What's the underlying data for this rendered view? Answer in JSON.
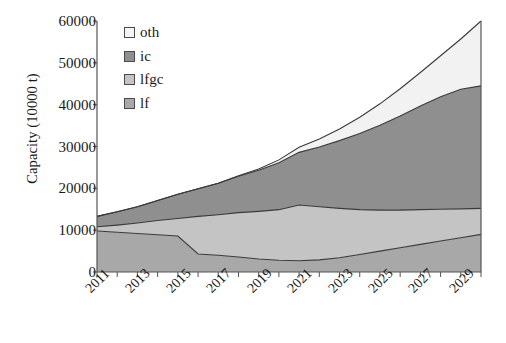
{
  "chart_data": {
    "type": "area",
    "stacked": true,
    "title": "",
    "xlabel": "",
    "ylabel": "Capacity (10000 t)",
    "ylim": [
      0,
      60000
    ],
    "ytick_labels": [
      "0",
      "10000",
      "20000",
      "30000",
      "40000",
      "50000",
      "60000"
    ],
    "ytick_values": [
      0,
      10000,
      20000,
      30000,
      40000,
      50000,
      60000
    ],
    "grid": false,
    "legend_position": "upper-left-inside",
    "x": [
      2011,
      2012,
      2013,
      2014,
      2015,
      2016,
      2017,
      2018,
      2019,
      2020,
      2021,
      2022,
      2023,
      2024,
      2025,
      2026,
      2027,
      2028,
      2029,
      2030
    ],
    "xtick_labels": [
      "2011",
      "2013",
      "2015",
      "2017",
      "2019",
      "2021",
      "2023",
      "2025",
      "2027",
      "2029"
    ],
    "xtick_values": [
      2011,
      2013,
      2015,
      2017,
      2019,
      2021,
      2023,
      2025,
      2027,
      2029
    ],
    "series": [
      {
        "name": "lf",
        "color": "#a8a8a8",
        "values": [
          9800,
          9500,
          9200,
          8900,
          8600,
          4300,
          4000,
          3600,
          3100,
          2800,
          2700,
          2900,
          3400,
          4200,
          5000,
          5800,
          6600,
          7400,
          8200,
          9000
        ]
      },
      {
        "name": "lfgc",
        "color": "#c4c4c4",
        "values": [
          1000,
          1700,
          2500,
          3400,
          4200,
          9000,
          9700,
          10600,
          11400,
          12100,
          13300,
          12700,
          11800,
          10700,
          9800,
          9000,
          8300,
          7600,
          6900,
          6200
        ]
      },
      {
        "name": "ic",
        "color": "#8f8f8f",
        "values": [
          2500,
          3200,
          3900,
          4800,
          5800,
          6600,
          7500,
          8700,
          9800,
          11200,
          12600,
          14300,
          16200,
          18200,
          20300,
          22500,
          24800,
          26900,
          28600,
          29300
        ]
      },
      {
        "name": "oth",
        "color": "#f2f2f2",
        "values": [
          0,
          0,
          0,
          0,
          0,
          0,
          0,
          100,
          300,
          700,
          1200,
          1900,
          2800,
          3900,
          5100,
          6500,
          8000,
          9800,
          12000,
          15500
        ]
      }
    ],
    "cumulative_tops": {
      "lf": [
        9800,
        9500,
        9200,
        8900,
        8600,
        4300,
        4000,
        3600,
        3100,
        2800,
        2700,
        2900,
        3400,
        4200,
        5000,
        5800,
        6600,
        7400,
        8200,
        9000
      ],
      "lfgc": [
        10800,
        11200,
        11700,
        12300,
        12800,
        13300,
        13700,
        14200,
        14500,
        14900,
        16000,
        15600,
        15200,
        14900,
        14800,
        14800,
        14900,
        15000,
        15100,
        15200
      ],
      "ic": [
        13300,
        14400,
        15600,
        17100,
        18600,
        19900,
        21200,
        22900,
        24300,
        26100,
        28600,
        29900,
        31400,
        33100,
        35100,
        37300,
        39700,
        41900,
        43700,
        44500
      ],
      "oth": [
        13300,
        14400,
        15600,
        17100,
        18600,
        19900,
        21200,
        23000,
        24600,
        26800,
        29800,
        31800,
        34200,
        37000,
        40200,
        43800,
        47700,
        51700,
        55700,
        60000
      ]
    }
  },
  "legend": {
    "items": [
      {
        "label": "oth",
        "color": "#f5f5f5"
      },
      {
        "label": "ic",
        "color": "#8f8f8f"
      },
      {
        "label": "lfgc",
        "color": "#c4c4c4"
      },
      {
        "label": "lf",
        "color": "#a8a8a8"
      }
    ]
  },
  "axes": {
    "y_title": "Capacity (10000 t)"
  }
}
